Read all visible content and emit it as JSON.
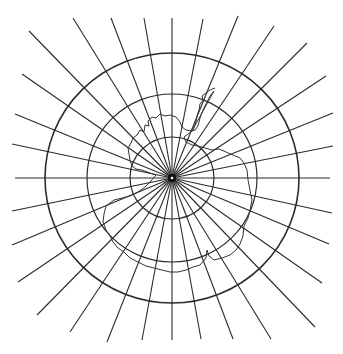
{
  "map": {
    "type": "polar azimuthal projection graticule",
    "subject": "Antarctica",
    "center": {
      "x": 172,
      "y": 178
    },
    "colors": {
      "line": "#2a2a2a",
      "coast": "#333333",
      "background": "#ffffff"
    },
    "parallels": [
      {
        "rx": 42,
        "ry": 41,
        "outer": false
      },
      {
        "rx": 85,
        "ry": 84,
        "outer": false
      },
      {
        "rx": 127,
        "ry": 125,
        "outer": true
      }
    ],
    "meridian_endpoints": [
      [
        172,
        18
      ],
      [
        203,
        19
      ],
      [
        238,
        16
      ],
      [
        274,
        26
      ],
      [
        307,
        43
      ],
      [
        326,
        76
      ],
      [
        333,
        113
      ],
      [
        333,
        146
      ],
      [
        330,
        178
      ],
      [
        332,
        213
      ],
      [
        329,
        244
      ],
      [
        322,
        283
      ],
      [
        315,
        327
      ],
      [
        271,
        339
      ],
      [
        233,
        339
      ],
      [
        201,
        339
      ],
      [
        172,
        340
      ],
      [
        142,
        340
      ],
      [
        107,
        342
      ],
      [
        70,
        332
      ],
      [
        37,
        315
      ],
      [
        18,
        282
      ],
      [
        12,
        245
      ],
      [
        12,
        211
      ],
      [
        15,
        178
      ],
      [
        12,
        144
      ],
      [
        15,
        114
      ],
      [
        22,
        74
      ],
      [
        29,
        31
      ],
      [
        73,
        18
      ],
      [
        111,
        18
      ],
      [
        144,
        18
      ]
    ],
    "coastline": "M 215 88 L 210 90 L 206 93 L 202 96 L 203 100 L 200 104 L 199 110 L 197 116 L 196 122 L 194 128 L 192 131 L 186 130 L 182 127 L 180 122 L 176 117 L 170 115 L 165 116 L 160 114 L 156 118 L 152 117 L 148 121 L 149 126 L 145 125 L 144 132 L 140 130 L 137 135 L 133 138 L 131 143 L 128 148 L 129 154 L 130 160 L 132 166 L 136 169 L 142 170 L 150 173 L 156 175 L 151 181 L 145 187 L 138 192 L 130 196 L 122 198 L 114 200 L 106 206 L 104 214 L 103 222 L 106 230 L 110 236 L 113 242 L 118 248 L 124 252 L 130 258 L 138 262 L 146 266 L 154 268 L 162 270 L 170 272 L 178 272 L 186 270 L 193 267 L 200 265 L 206 258 L 207 250 L 209 256 L 214 260 L 222 258 L 230 255 L 236 250 L 240 244 L 243 236 L 244 226 L 248 218 L 250 210 L 252 200 L 250 190 L 248 180 L 247 170 L 244 163 L 240 158 L 233 155 L 226 152 L 219 149 L 212 150 L 205 148 L 198 146 L 192 145 L 186 142 L 184 137 L 188 134 L 192 131 M 192 131 L 195 130 L 198 126 L 200 118 L 203 110 L 206 104 L 210 96 L 214 91 Z"
  }
}
